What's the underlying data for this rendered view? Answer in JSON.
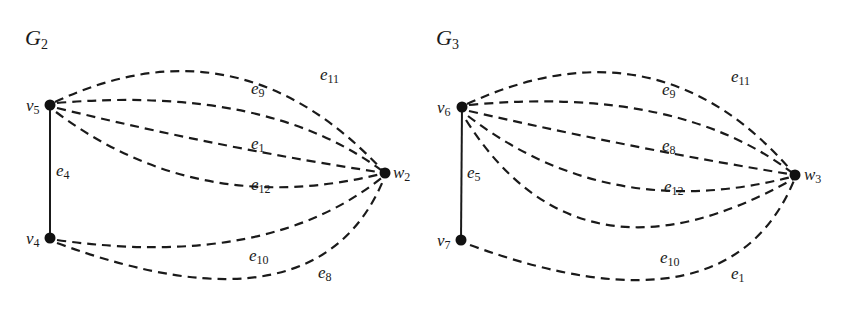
{
  "graphs": [
    {
      "id": "G2",
      "title": {
        "main": "G",
        "sub": "2"
      },
      "vertices": {
        "v5": {
          "main": "v",
          "sub": "5"
        },
        "v4": {
          "main": "v",
          "sub": "4"
        },
        "w2": {
          "main": "w",
          "sub": "2"
        }
      },
      "edges": {
        "e4": {
          "main": "e",
          "sub": "4",
          "from": "v5",
          "to": "v4",
          "style": "solid"
        },
        "e11": {
          "main": "e",
          "sub": "11",
          "from": "v5",
          "to": "w2",
          "style": "dashed"
        },
        "e9": {
          "main": "e",
          "sub": "9",
          "from": "v5",
          "to": "w2",
          "style": "dashed"
        },
        "e1": {
          "main": "e",
          "sub": "1",
          "from": "v5",
          "to": "w2",
          "style": "dashed"
        },
        "e12": {
          "main": "e",
          "sub": "12",
          "from": "v5",
          "to": "w2",
          "style": "dashed"
        },
        "e10": {
          "main": "e",
          "sub": "10",
          "from": "v4",
          "to": "w2",
          "style": "dashed"
        },
        "e8": {
          "main": "e",
          "sub": "8",
          "from": "v4",
          "to": "w2",
          "style": "dashed"
        }
      }
    },
    {
      "id": "G3",
      "title": {
        "main": "G",
        "sub": "3"
      },
      "vertices": {
        "v6": {
          "main": "v",
          "sub": "6"
        },
        "v7": {
          "main": "v",
          "sub": "7"
        },
        "w3": {
          "main": "w",
          "sub": "3"
        }
      },
      "edges": {
        "e5": {
          "main": "e",
          "sub": "5",
          "from": "v6",
          "to": "v7",
          "style": "solid"
        },
        "e11": {
          "main": "e",
          "sub": "11",
          "from": "v6",
          "to": "w3",
          "style": "dashed"
        },
        "e9": {
          "main": "e",
          "sub": "9",
          "from": "v6",
          "to": "w3",
          "style": "dashed"
        },
        "e8": {
          "main": "e",
          "sub": "8",
          "from": "v6",
          "to": "w3",
          "style": "dashed"
        },
        "e12": {
          "main": "e",
          "sub": "12",
          "from": "v6",
          "to": "w3",
          "style": "dashed"
        },
        "e10": {
          "main": "e",
          "sub": "10",
          "from": "v6",
          "to": "w3",
          "style": "dashed"
        },
        "e1": {
          "main": "e",
          "sub": "1",
          "from": "v7",
          "to": "w3",
          "style": "dashed"
        }
      }
    }
  ]
}
